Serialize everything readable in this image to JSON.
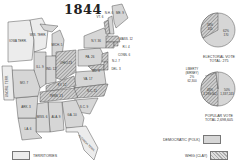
{
  "title": "1844",
  "colors": {
    "democratic": "#d6d6d6",
    "whig_hatch": "#9a9a9a",
    "territory": "#ececec",
    "border": "#555555"
  },
  "states": [
    {
      "abbr": "IOWA TERR.",
      "party": "territory"
    },
    {
      "abbr": "WIS. TERR.",
      "party": "territory"
    },
    {
      "abbr": "MICH. 5",
      "party": "democratic"
    },
    {
      "abbr": "ILL. 9",
      "party": "democratic"
    },
    {
      "abbr": "IND. 12",
      "party": "democratic"
    },
    {
      "abbr": "OHIO 23",
      "party": "whig"
    },
    {
      "abbr": "PA. 26",
      "party": "democratic"
    },
    {
      "abbr": "N.Y. 36",
      "party": "democratic"
    },
    {
      "abbr": "VT. 6",
      "party": "whig"
    },
    {
      "abbr": "N.H. 6",
      "party": "democratic"
    },
    {
      "abbr": "ME. 9",
      "party": "democratic"
    },
    {
      "abbr": "MASS. 12",
      "party": "whig"
    },
    {
      "abbr": "R.I. 4",
      "party": "whig"
    },
    {
      "abbr": "CONN. 6",
      "party": "whig"
    },
    {
      "abbr": "N.J. 7",
      "party": "whig"
    },
    {
      "abbr": "DEL. 3",
      "party": "whig"
    },
    {
      "abbr": "MD. 8",
      "party": "whig"
    },
    {
      "abbr": "VA. 17",
      "party": "democratic"
    },
    {
      "abbr": "KY. 12",
      "party": "whig"
    },
    {
      "abbr": "TENN. 13",
      "party": "whig"
    },
    {
      "abbr": "N.C. 11",
      "party": "whig"
    },
    {
      "abbr": "S.C. 9",
      "party": "democratic"
    },
    {
      "abbr": "GA. 10",
      "party": "democratic"
    },
    {
      "abbr": "ALA. 9",
      "party": "democratic"
    },
    {
      "abbr": "MISS. 6",
      "party": "democratic"
    },
    {
      "abbr": "LA. 6",
      "party": "democratic"
    },
    {
      "abbr": "ARK. 3",
      "party": "democratic"
    },
    {
      "abbr": "MO. 7",
      "party": "democratic"
    },
    {
      "abbr": "UNORG. TERR.",
      "party": "territory"
    },
    {
      "abbr": "FLORIDA TERR.",
      "party": "territory"
    }
  ],
  "electoral_pie": {
    "whig_pct": "38%",
    "whig_votes": "105",
    "dem_pct": "62%",
    "dem_votes": "170",
    "caption": "ELECTORAL VOTE",
    "total": "TOTAL: 275"
  },
  "popular_pie": {
    "liberty_label": "LIBERTY",
    "liberty_candidate": "(BIRNEY)",
    "liberty_pct": "2%",
    "liberty_votes": "62,300",
    "whig_pct": "48%",
    "whig_votes": "1,299,062",
    "dem_pct": "50%",
    "dem_votes": "1,337,243",
    "caption": "POPULAR VOTE",
    "total": "TOTAL 2,698,605"
  },
  "legend": {
    "democratic": "DEMOCRATIC (POLK)",
    "whig": "WHIG (CLAY)",
    "territories": "TERRITORIES"
  }
}
